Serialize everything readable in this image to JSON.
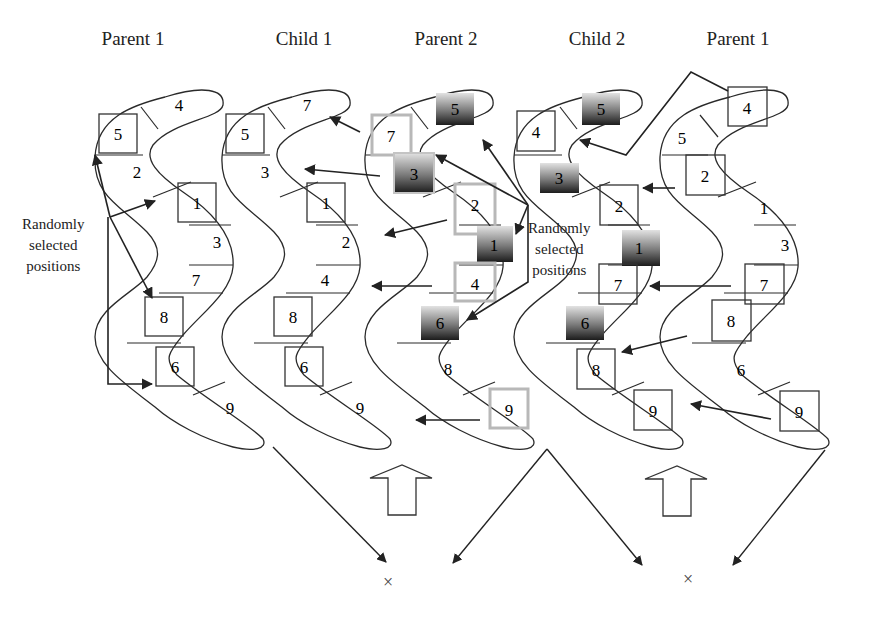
{
  "diagram": {
    "kind": "crossover-operation",
    "colors": {
      "stroke": "#2a2a2a",
      "selected_box": "#333333",
      "faded_box": "#b8b8b8",
      "dark_gradient_top": "#d8d8d8",
      "dark_gradient_bottom": "#1f1f1f"
    },
    "columns": [
      {
        "id": "parent1-left",
        "label": "Parent 1",
        "label_x": 133,
        "genes": [
          "5",
          "4",
          "2",
          "1",
          "3",
          "7",
          "8",
          "6",
          "9"
        ],
        "boxed": [
          "5",
          "1",
          "8",
          "6"
        ]
      },
      {
        "id": "child1",
        "label": "Child 1",
        "label_x": 304,
        "genes": [
          "5",
          "7",
          "3",
          "1",
          "2",
          "4",
          "8",
          "6",
          "9"
        ],
        "boxed": [
          "5",
          "1",
          "8",
          "6"
        ]
      },
      {
        "id": "parent2",
        "label": "Parent 2",
        "label_x": 446,
        "genes": [
          "7",
          "5",
          "3",
          "2",
          "1",
          "4",
          "6",
          "8",
          "9"
        ],
        "faded": [
          "7",
          "2",
          "4",
          "9"
        ],
        "shaded": [
          "5",
          "3",
          "1",
          "6"
        ]
      },
      {
        "id": "child2",
        "label": "Child 2",
        "label_x": 597,
        "genes": [
          "4",
          "5",
          "3",
          "2",
          "1",
          "7",
          "6",
          "8",
          "9"
        ],
        "boxed": [
          "4",
          "2",
          "7",
          "8",
          "9"
        ],
        "shaded": [
          "5",
          "3",
          "1",
          "6"
        ]
      },
      {
        "id": "parent1-right",
        "label": "Parent 1",
        "label_x": 738,
        "genes": [
          "4",
          "5",
          "2",
          "1",
          "3",
          "7",
          "8",
          "6",
          "9"
        ],
        "boxed": [
          "4",
          "2",
          "7",
          "8",
          "9"
        ]
      }
    ],
    "annotations": [
      {
        "id": "note-left",
        "lines": [
          "Randomly",
          "selected",
          "positions"
        ]
      },
      {
        "id": "note-middle",
        "lines": [
          "Randomly",
          "selected",
          "positions"
        ]
      }
    ],
    "crossover_marks": [
      "×",
      "×"
    ]
  }
}
